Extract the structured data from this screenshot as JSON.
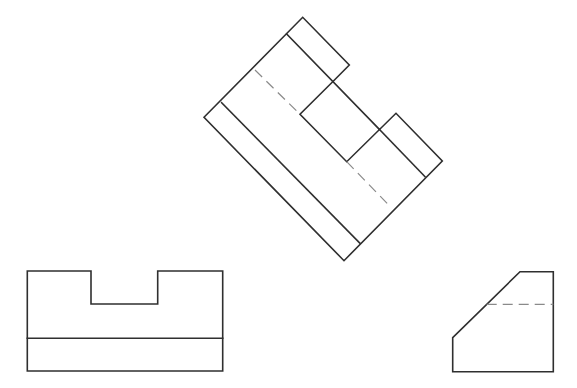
{
  "diagram": {
    "type": "orthographic-projection",
    "colors": {
      "background": "#ffffff",
      "visible_line": "#2f2f2f",
      "hidden_line": "#8a8a8a"
    },
    "views": {
      "rotated": {
        "outline": "204,117.3 302.7,17.3 349.3,65 332.7,81.7 300,114.3 346.7,161.7 396,113.3 442.3,161 344,260.7",
        "lines": [
          {
            "x1": 221.7,
            "y1": 102.7,
            "x2": 360,
            "y2": 243.3
          },
          {
            "x1": 286.7,
            "y1": 34,
            "x2": 379.3,
            "y2": 129.3
          },
          {
            "x1": 379.3,
            "y1": 129.3,
            "x2": 425,
            "y2": 176.7
          }
        ],
        "hidden_lines": [
          {
            "x1": 255,
            "y1": 70,
            "x2": 300,
            "y2": 114.3
          },
          {
            "x1": 346.7,
            "y1": 161.7,
            "x2": 391,
            "y2": 207.3
          }
        ]
      },
      "front": {
        "outline": "27.3,271 91,271 91,304 157.7,304 157.7,271 222.7,271 222.7,371 27.3,371",
        "lines": [
          {
            "x1": 27.3,
            "y1": 338.3,
            "x2": 222.7,
            "y2": 338.3
          }
        ]
      },
      "side": {
        "outline": "520,271.7 553.3,271.7 553.3,371.7 452.7,371.7 452.7,337.7",
        "hidden_lines": [
          {
            "x1": 486.7,
            "y1": 304.3,
            "x2": 553.3,
            "y2": 304.3
          }
        ]
      }
    }
  }
}
